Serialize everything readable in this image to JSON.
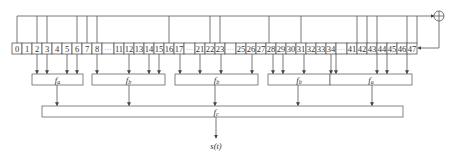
{
  "diagram": {
    "register": {
      "y": 43,
      "height": 11,
      "cells": [
        {
          "label": "0",
          "x": 12,
          "w": 10
        },
        {
          "label": "1",
          "x": 22,
          "w": 10
        },
        {
          "label": "2",
          "x": 32,
          "w": 10
        },
        {
          "label": "3",
          "x": 42,
          "w": 10
        },
        {
          "label": "4",
          "x": 52,
          "w": 10
        },
        {
          "label": "5",
          "x": 62,
          "w": 10
        },
        {
          "label": "6",
          "x": 72,
          "w": 10
        },
        {
          "label": "7",
          "x": 82,
          "w": 10
        },
        {
          "label": "8",
          "x": 92,
          "w": 10
        },
        {
          "label": "···",
          "x": 102,
          "w": 12,
          "dots": true
        },
        {
          "label": "11",
          "x": 114,
          "w": 10
        },
        {
          "label": "12",
          "x": 124,
          "w": 10
        },
        {
          "label": "13",
          "x": 134,
          "w": 10
        },
        {
          "label": "14",
          "x": 144,
          "w": 10
        },
        {
          "label": "15",
          "x": 154,
          "w": 10
        },
        {
          "label": "16",
          "x": 164,
          "w": 10
        },
        {
          "label": "17",
          "x": 174,
          "w": 10
        },
        {
          "label": "···",
          "x": 184,
          "w": 11,
          "dots": true
        },
        {
          "label": "21",
          "x": 195,
          "w": 10
        },
        {
          "label": "22",
          "x": 205,
          "w": 10
        },
        {
          "label": "23",
          "x": 215,
          "w": 10
        },
        {
          "label": "···",
          "x": 225,
          "w": 11,
          "dots": true
        },
        {
          "label": "25",
          "x": 236,
          "w": 10
        },
        {
          "label": "26",
          "x": 246,
          "w": 10
        },
        {
          "label": "27",
          "x": 256,
          "w": 10
        },
        {
          "label": "28",
          "x": 266,
          "w": 10
        },
        {
          "label": "29",
          "x": 276,
          "w": 10
        },
        {
          "label": "30",
          "x": 286,
          "w": 10
        },
        {
          "label": "31",
          "x": 296,
          "w": 10
        },
        {
          "label": "32",
          "x": 306,
          "w": 10
        },
        {
          "label": "33",
          "x": 316,
          "w": 10
        },
        {
          "label": "34",
          "x": 326,
          "w": 10
        },
        {
          "label": "···",
          "x": 336,
          "w": 11,
          "dots": true
        },
        {
          "label": "41",
          "x": 347,
          "w": 10
        },
        {
          "label": "42",
          "x": 357,
          "w": 10
        },
        {
          "label": "43",
          "x": 367,
          "w": 10
        },
        {
          "label": "44",
          "x": 377,
          "w": 10
        },
        {
          "label": "45",
          "x": 387,
          "w": 10
        },
        {
          "label": "46",
          "x": 397,
          "w": 10
        },
        {
          "label": "47",
          "x": 407,
          "w": 10
        }
      ]
    },
    "feedback": {
      "top_y": 16,
      "taps_x": [
        17,
        37,
        47,
        77,
        87,
        97,
        169,
        210,
        220,
        269,
        301,
        357,
        367,
        377,
        407,
        417
      ],
      "xor": {
        "cx": 439,
        "cy": 16,
        "r": 5
      },
      "return_y": 48
    },
    "filters": [
      {
        "id": "fa1",
        "label": "f",
        "sub": "a",
        "x": 32,
        "w": 51,
        "y": 74,
        "h": 11,
        "inputs_x": [
          37,
          47,
          67,
          77
        ],
        "output_x": 57
      },
      {
        "id": "fb1",
        "label": "f",
        "sub": "b",
        "x": 92,
        "w": 73,
        "y": 74,
        "h": 11,
        "inputs_x": [
          97,
          129,
          149,
          159
        ],
        "output_x": 129
      },
      {
        "id": "fb2",
        "label": "f",
        "sub": "b",
        "x": 175,
        "w": 83,
        "y": 74,
        "h": 11,
        "inputs_x": [
          180,
          200,
          221,
          252
        ],
        "output_x": 215
      },
      {
        "id": "fb3",
        "label": "f",
        "sub": "b",
        "x": 268,
        "w": 62,
        "y": 74,
        "h": 11,
        "inputs_x": [
          273,
          283,
          304,
          331
        ],
        "output_x": 298
      },
      {
        "id": "fa2",
        "label": "f",
        "sub": "a",
        "x": 330,
        "w": 82,
        "y": 74,
        "h": 11,
        "inputs_x": [
          336,
          377,
          387,
          407
        ],
        "output_x": 372
      }
    ],
    "combiner": {
      "label": "f",
      "sub": "c",
      "x": 42,
      "w": 361,
      "y": 106,
      "h": 11,
      "output_x": 216
    },
    "output": {
      "label": "s(t)",
      "arrow_end_y": 138,
      "text_y": 149
    }
  }
}
